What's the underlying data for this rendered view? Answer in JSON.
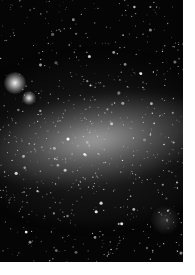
{
  "image": {
    "subject": "galaxy star field photograph",
    "description": "Black-and-white photograph of an irregular galaxy with a bright central bar and dense star field",
    "colors": {
      "background": "#ffffff",
      "sky": "#050505",
      "bar_glow": "#c8c8c8",
      "stars": "#ffffff"
    },
    "region": {
      "x": 0,
      "y": 0,
      "width": 183,
      "height": 262
    }
  }
}
